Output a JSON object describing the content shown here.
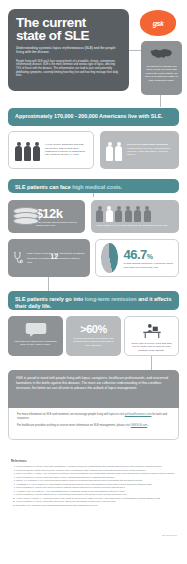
{
  "header": {
    "title_line1": "The current",
    "title_line2": "state of SLE",
    "subtitle": "Understanding systemic lupus erythematosus (SLE) and the people living with the disease.",
    "intro": "People living with SLE each face varying levels of a treatable, chronic, autoimmune inflammatory disease. SLE is the most common and serious type of lupus, affecting 70% of those with the disease. This inflammation can lead to pain and potentially debilitating symptoms, severely limiting how they live and how they manage their daily lives.",
    "logo_text": "gsk",
    "logo_name": "gsk-logo"
  },
  "map_callout": {
    "icon": "us-map-icon",
    "text": "It is difficult to estimate how many people are living with SLE in the United States, as there is no national registry to track diagnosed cases."
  },
  "prevalence": {
    "banner_bold": "Approximately 170,000 - 200,000",
    "banner_rest": "Americans live with SLE.",
    "left_card": {
      "icons": [
        "female-figure-icon",
        "female-figure-icon",
        "female-figure-icon"
      ],
      "text": "9 in 10 people diagnosed with SLE are women. SLE is most often diagnosed in women of childbearing age, between 15 and 44 years."
    },
    "right_card": {
      "icons": [
        "female-figure-icon",
        "female-figure-icon"
      ],
      "text_bold": "SLE is 2 to 3 times more prevalent",
      "text_rest": "among women of color, including Black, Hispanic, Asian and Native American women."
    }
  },
  "costs": {
    "banner_bold": "SLE patients can face",
    "banner_light": "high medical costs.",
    "cost_card": {
      "icon": "coin-stack-icon",
      "value": "$12k",
      "text": "is the average direct medical cost per patient each year."
    },
    "hospital_card": {
      "icons_total": 6,
      "icons_highlighted": 1,
      "text": "Approximately 1 in 6 people with SLE are hospitalized each year."
    }
  },
  "treatment": {
    "steth_card": {
      "icon": "stethoscope-icon",
      "text_pre": "Many people living with SLE visit multiple healthcare providers, averaging",
      "value": "12",
      "text_post": "physician visits per year."
    },
    "pie_card": {
      "chart": "pie",
      "value": "46.7",
      "unit": "%",
      "text": "of SLE patients report they experience flares more than four times each year."
    }
  },
  "daily_life": {
    "banner_bold_a": "SLE patients rarely go into",
    "banner_light": "long-term remission",
    "banner_bold_b": "and it affects their daily life.",
    "panel1": {
      "icon": "speech-bubble-icon",
      "text": "More than one third report a diagnosis delay of four years or more."
    },
    "panel2": {
      "value": ">60%",
      "text": "of SLE patients say the disease has impacted their ability to participate in daily activities."
    },
    "panel3": {
      "icon": "desk-work-icon",
      "text": "Nearly half of people living with SLE are no longer able to work full-time because of the disease."
    }
  },
  "statement": {
    "text": "GSK is proud to stand with people living with lupus, caregivers, healthcare professionals, and concerned lawmakers in the battle against this disease. The more our collective understanding of this condition increases, the better we can all unite to advance the outlook of lupus management."
  },
  "closing": {
    "line1_pre": "For more information on SLE and treatment, we encourage people living with lupus to visit",
    "line1_link": "gskhealthconnect.com",
    "line1_post": "for tools and resources.",
    "line2_pre": "For healthcare providers wishing to receive more information on SLE management, please visit",
    "line2_link": "GSKSLE.com",
    "line2_post": "."
  },
  "references": {
    "heading": "References",
    "items": [
      "Lupus Foundation of America. Lupus facts and statistics. Accessed via lupus.org. Understanding who is affected and prevalence rates reported in published literature.",
      "Centers for Disease Control and Prevention. Systemic lupus erythematosus (SLE). National public health data and surveillance registries summary.",
      "Izmirly PM, Parton H, Wang L, et al. Prevalence of systemic lupus erythematosus in the United States: estimates from a meta-analysis of the Centers for Disease Control registries.",
      "Lupus Foundation of America. Lupus and women of color: understanding disparities in diagnosis and outcomes.",
      "Carls G, Li T, Panopalis P, et al. Direct and indirect costs to employers of patients with systemic lupus erythematosus with and without nephritis.",
      "Anandarajah AP, Luc M, Ritchlin CT. Hospitalisation of patients with systemic lupus erythematosus is a major cause of direct and indirect healthcare costs.",
      "Lupus Foundation of America. The impact of lupus on patients: national patient survey results on physician visits and flares.",
      "Al Sawah S, Daly RP, Foster SA, et al. Understanding delay in diagnosis, access to care and satisfaction with care in lupus.",
      "Lupus Foundation of America. National survey: lupus patients report impact of the disease on daily activities and quality of life.",
      "Yelin E, Trupin L, Yazdany J. A prospective study of the impact of current poverty, history of poverty, and exiting poverty on accumulation of disease damage in SLE.",
      "Lupus Foundation of America. Lupus and employment: loss of work and disability among people living with lupus.",
      "GSK data on file. Systemic lupus erythematosus disease burden and management overview."
    ]
  },
  "footer_code": "NP-US-000000"
}
